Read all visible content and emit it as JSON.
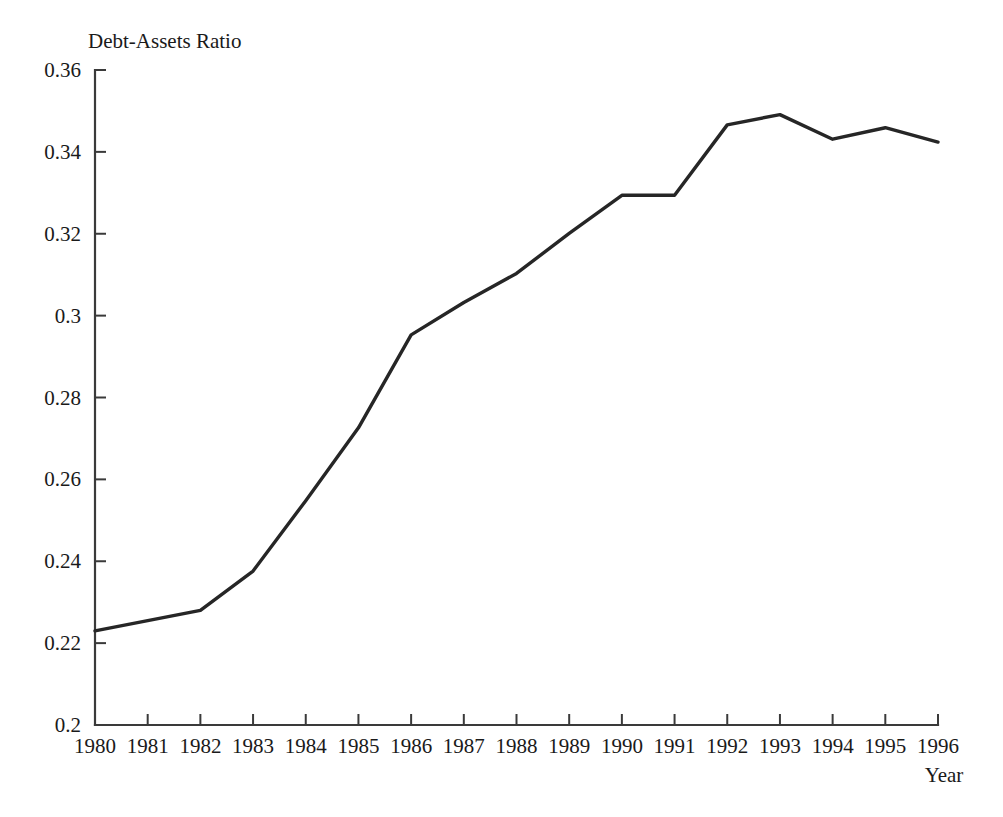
{
  "chart_data": {
    "type": "line",
    "title": "",
    "ylabel": "Debt-Assets Ratio",
    "xlabel": "Year",
    "x": [
      1980,
      1981,
      1982,
      1983,
      1984,
      1985,
      1986,
      1987,
      1988,
      1989,
      1990,
      1991,
      1992,
      1993,
      1994,
      1995,
      1996
    ],
    "series": [
      {
        "name": "Debt-Assets Ratio",
        "values": [
          0.223,
          0.2255,
          0.228,
          0.2376,
          0.2548,
          0.2726,
          0.2953,
          0.3032,
          0.3103,
          0.3201,
          0.3294,
          0.3294,
          0.3466,
          0.3491,
          0.3431,
          0.3459,
          0.3424
        ]
      }
    ],
    "xtick_labels": [
      "1980",
      "1981",
      "1982",
      "1983",
      "1984",
      "1985",
      "1986",
      "1987",
      "1988",
      "1989",
      "1990",
      "1991",
      "1992",
      "1993",
      "1994",
      "1995",
      "1996"
    ],
    "ytick_labels": [
      "0.2",
      "0.22",
      "0.24",
      "0.26",
      "0.28",
      "0.3",
      "0.32",
      "0.34",
      "0.36"
    ],
    "ytick_values": [
      0.2,
      0.22,
      0.24,
      0.26,
      0.28,
      0.3,
      0.32,
      0.34,
      0.36
    ],
    "ylim": [
      0.2,
      0.36
    ],
    "xlim": [
      1980,
      1996
    ],
    "grid": false,
    "legend": false,
    "legend_position": "none",
    "line_color": "#262626",
    "axis_color": "#3a3a3a"
  }
}
